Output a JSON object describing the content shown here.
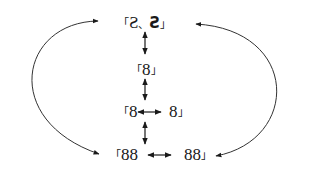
{
  "diagram": {
    "nodes": {
      "top": {
        "open": "「",
        "left": "S",
        "sep": "、",
        "right": "S",
        "close": "」"
      },
      "single": {
        "open": "「",
        "text": "8",
        "close": "」"
      },
      "pair_left": {
        "open": "「",
        "text": "8"
      },
      "pair_right": {
        "text": "8",
        "close": "」"
      },
      "double_left": {
        "open": "「",
        "text": "88"
      },
      "double_right": {
        "text": "88",
        "close": "」"
      }
    },
    "edges": [
      {
        "from": "top",
        "to": "single",
        "type": "bidirectional"
      },
      {
        "from": "single",
        "to": "pair",
        "type": "bidirectional"
      },
      {
        "from": "pair_left",
        "to": "pair_right",
        "type": "bidirectional"
      },
      {
        "from": "pair",
        "to": "double",
        "type": "bidirectional"
      },
      {
        "from": "double_left",
        "to": "double_right",
        "type": "bidirectional"
      },
      {
        "from": "top",
        "to": "double_left",
        "type": "curved-left-bidirectional"
      },
      {
        "from": "top",
        "to": "double_right",
        "type": "curved-right-bidirectional"
      }
    ],
    "colors": {
      "line": "#1a1a1a",
      "background": "#ffffff"
    }
  }
}
